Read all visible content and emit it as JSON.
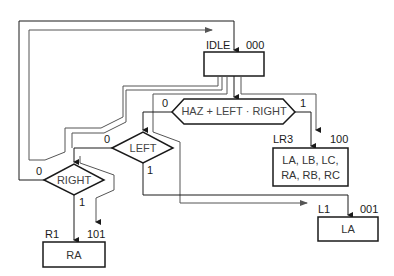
{
  "states": {
    "idle": {
      "name": "IDLE",
      "code": "000",
      "outputs": ""
    },
    "lr3": {
      "name": "LR3",
      "code": "100",
      "outputs_line1": "LA, LB, LC,",
      "outputs_line2": "RA, RB, RC"
    },
    "l1": {
      "name": "L1",
      "code": "001",
      "outputs": "LA"
    },
    "r1": {
      "name": "R1",
      "code": "101",
      "outputs": "RA"
    }
  },
  "decisions": {
    "haz": {
      "condition": "HAZ + LEFT · RIGHT",
      "false_label": "0",
      "true_label": "1"
    },
    "left": {
      "condition": "LEFT",
      "false_label": "0",
      "true_label": "1"
    },
    "right": {
      "condition": "RIGHT",
      "false_label": "0",
      "true_label": "1"
    }
  },
  "colors": {
    "line": "#1a1a1a",
    "thin_line": "#555555",
    "text": "#333333"
  }
}
